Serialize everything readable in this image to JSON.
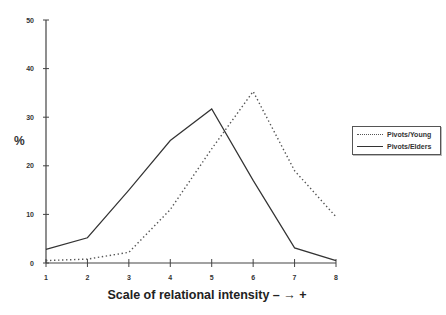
{
  "chart_data": {
    "type": "line",
    "title": "",
    "xlabel": "Scale of relational intensity – → +",
    "ylabel": "%",
    "x": [
      1,
      2,
      3,
      4,
      5,
      6,
      7,
      8
    ],
    "xticks": [
      "1",
      "2",
      "3",
      "4",
      "5",
      "6",
      "7",
      "8"
    ],
    "yticks": [
      "0",
      "10",
      "20",
      "30",
      "40",
      "50"
    ],
    "ylim": [
      0,
      50
    ],
    "xlim": [
      1,
      8
    ],
    "grid": false,
    "legend_position": "right",
    "series": [
      {
        "name": "Pivots/Young",
        "style": "dotted",
        "color": "#555555",
        "values": [
          0.5,
          0.8,
          2.2,
          11,
          23.5,
          35.3,
          19,
          9.5
        ]
      },
      {
        "name": "Pivots/Elders",
        "style": "solid",
        "color": "#333333",
        "values": [
          2.8,
          5.2,
          15,
          25.2,
          31.7,
          17,
          3.1,
          0.5
        ]
      }
    ]
  },
  "legend": {
    "items": [
      {
        "label": "Pivots/Young"
      },
      {
        "label": "Pivots/Elders"
      }
    ]
  }
}
